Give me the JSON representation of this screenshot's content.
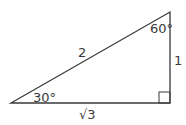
{
  "diagram": {
    "type": "right-triangle",
    "vertices": {
      "a": {
        "x": 11,
        "y": 103
      },
      "b": {
        "x": 170,
        "y": 12
      },
      "c": {
        "x": 170,
        "y": 103
      }
    },
    "sides": {
      "hypotenuse": "2",
      "vertical": "1",
      "horizontal": "√3"
    },
    "angles": {
      "bottom_left": "30°",
      "top_right": "60°"
    },
    "right_angle_marker": true,
    "stroke_color": "#3a3a3a"
  }
}
